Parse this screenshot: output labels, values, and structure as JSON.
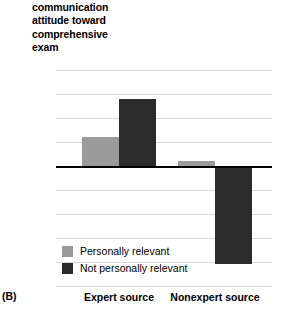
{
  "panel": {
    "label": "(B)"
  },
  "chart_data": {
    "type": "bar",
    "title": "",
    "ylabel": "communication\nattitude toward\ncomprehensive\nexam",
    "xlabel": "",
    "categories": [
      "Expert source",
      "Nonexpert source"
    ],
    "series": [
      {
        "name": "Personally relevant",
        "color": "#9a9a9a",
        "values": [
          0.12,
          0.02
        ]
      },
      {
        "name": "Not personally relevant",
        "color": "#2b2b2b",
        "values": [
          0.28,
          -0.41
        ]
      }
    ],
    "ylim": [
      -0.5,
      0.4
    ],
    "ytick_labels": [
      "0.4",
      "0.3",
      "0.2",
      "0.1",
      "0",
      "–0.1",
      "–0.2",
      "–0.3",
      "–0.4",
      "–0.5"
    ],
    "ytick_values": [
      0.4,
      0.3,
      0.2,
      0.1,
      0,
      -0.1,
      -0.2,
      -0.3,
      -0.4,
      -0.5
    ],
    "grid": true,
    "zero_line": true,
    "legend_position": "inside-bottom-left"
  }
}
